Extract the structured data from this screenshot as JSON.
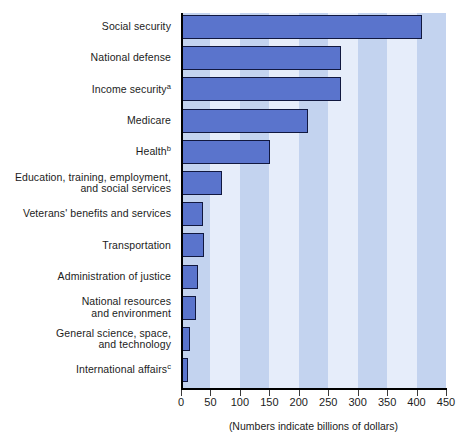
{
  "chart_data": {
    "type": "bar",
    "orientation": "horizontal",
    "title": "",
    "subtitle": "",
    "xlabel": "(Numbers indicate billions of dollars)",
    "ylabel": "",
    "xlim": [
      0,
      450
    ],
    "xticks": [
      0,
      50,
      100,
      150,
      200,
      250,
      300,
      350,
      400,
      450
    ],
    "xtick_labels": [
      "0",
      "50",
      "100",
      "150",
      "200",
      "250",
      "300",
      "350",
      "400",
      "450"
    ],
    "grid": false,
    "banded_background": true,
    "legend": null,
    "categories": [
      "Social security",
      "National defense",
      "Income security",
      "Medicare",
      "Health",
      "Education, training, employment,\nand social services",
      "Veterans' benefits and services",
      "Transportation",
      "Administration of justice",
      "National resources\nand environment",
      "General science, space,\nand technology",
      "International affairs"
    ],
    "category_footnotes": [
      "",
      "",
      "a",
      "",
      "b",
      "",
      "",
      "",
      "",
      "",
      "",
      "c"
    ],
    "values": [
      409,
      272,
      272,
      216,
      151,
      70,
      38,
      39,
      29,
      25,
      15,
      12
    ],
    "units": "billions of dollars"
  },
  "chart": {
    "caption": "(Numbers indicate billions of dollars)",
    "colors": {
      "bar_fill": "#5a74cc",
      "bar_stroke": "#11183f",
      "band_light": "#e6edfa",
      "band_dark": "#c3d3ef",
      "axis": "#000000",
      "text": "#1c1c1c",
      "background": "#ffffff"
    },
    "rows": [
      {
        "label": "Social security",
        "footnote": "",
        "value": 409
      },
      {
        "label": "National defense",
        "footnote": "",
        "value": 272
      },
      {
        "label": "Income security",
        "footnote": "a",
        "value": 272
      },
      {
        "label": "Medicare",
        "footnote": "",
        "value": 216
      },
      {
        "label": "Health",
        "footnote": "b",
        "value": 151
      },
      {
        "label": "Education, training, employment,\nand social services",
        "footnote": "",
        "value": 70
      },
      {
        "label": "Veterans' benefits and services",
        "footnote": "",
        "value": 38
      },
      {
        "label": "Transportation",
        "footnote": "",
        "value": 39
      },
      {
        "label": "Administration of justice",
        "footnote": "",
        "value": 29
      },
      {
        "label": "National resources\nand environment",
        "footnote": "",
        "value": 25
      },
      {
        "label": "General science, space,\nand technology",
        "footnote": "",
        "value": 15
      },
      {
        "label": "International affairs",
        "footnote": "c",
        "value": 12
      }
    ]
  }
}
